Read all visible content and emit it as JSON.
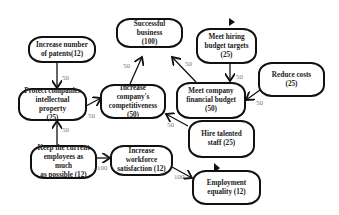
{
  "diagram": {
    "nodes": [
      {
        "id": "patents",
        "label": "Increase number\nof patents(12)"
      },
      {
        "id": "success",
        "label": "Successful business\n(100)"
      },
      {
        "id": "hiring",
        "label": "Meet hiring\nbudget targets\n(25)"
      },
      {
        "id": "costs",
        "label": "Reduce costs\n(25)"
      },
      {
        "id": "ip",
        "label": "Protect companies\nintellectual property\n(25)"
      },
      {
        "id": "compet",
        "label": "Increase company's\ncompetitiveness\n(50)"
      },
      {
        "id": "finbudget",
        "label": "Meet company\nfinancial budget\n(50)"
      },
      {
        "id": "hire",
        "label": "Hire talented\nstaff  (25)"
      },
      {
        "id": "keep",
        "label": "Keep the current\nemployees as much\nas possible (12)"
      },
      {
        "id": "satisf",
        "label": "Increase workforce\nsatisfaction (12)"
      },
      {
        "id": "equality",
        "label": "Employment\nequality (12)"
      }
    ],
    "edges": [
      {
        "from": "patents",
        "to": "ip",
        "weight": "50"
      },
      {
        "from": "keep",
        "to": "ip",
        "weight": "50"
      },
      {
        "from": "ip",
        "to": "compet",
        "weight": "50"
      },
      {
        "from": "compet",
        "to": "success",
        "weight": "50"
      },
      {
        "from": "finbudget",
        "to": "success",
        "weight": "50"
      },
      {
        "from": "hiring",
        "to": "finbudget",
        "weight": "50"
      },
      {
        "from": "costs",
        "to": "finbudget",
        "weight": "50"
      },
      {
        "from": "hire",
        "to": "compet",
        "weight": "50"
      },
      {
        "from": "keep",
        "to": "satisf",
        "weight": "100"
      },
      {
        "from": "satisf",
        "to": "equality",
        "weight": "100"
      }
    ],
    "markers": [
      {
        "near": "hiring",
        "type": "flag"
      },
      {
        "near": "equality",
        "type": "flag"
      }
    ]
  }
}
